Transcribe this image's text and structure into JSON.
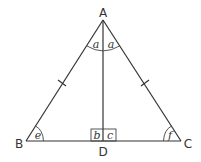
{
  "diagram": {
    "type": "isosceles-triangle-with-altitude",
    "vertices": {
      "A": {
        "label": "A",
        "x": 103,
        "y": 20
      },
      "B": {
        "label": "B",
        "x": 26,
        "y": 141
      },
      "C": {
        "label": "C",
        "x": 181,
        "y": 141
      },
      "D": {
        "label": "D",
        "x": 103,
        "y": 141
      }
    },
    "segments": [
      "AB",
      "AC",
      "BC",
      "AD"
    ],
    "equal_sides_marks": [
      "AB",
      "AC"
    ],
    "angle_labels": {
      "A_left": "a",
      "A_right": "a",
      "D_left": "b",
      "D_right": "c",
      "B": "e",
      "C": "f"
    },
    "right_angle_at": "D"
  }
}
